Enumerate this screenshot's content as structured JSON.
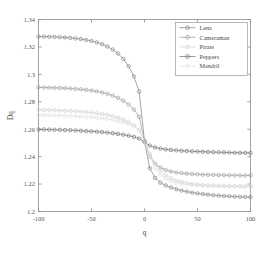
{
  "chart_data": {
    "type": "line",
    "title": "",
    "xlabel": "q",
    "ylabel": "Dq",
    "xlim": [
      -100,
      100
    ],
    "ylim": [
      1.2,
      1.34
    ],
    "grid": false,
    "legend_position": "top-right",
    "xticks": [
      "-100",
      "-50",
      "0",
      "50",
      "100"
    ],
    "xtick_values": [
      -100,
      -50,
      0,
      50,
      100
    ],
    "yticks": [
      "1.2",
      "1.22",
      "1.24",
      "1.26",
      "1.28",
      "1.3",
      "1.32",
      "1.34"
    ],
    "ytick_values": [
      1.2,
      1.22,
      1.24,
      1.26,
      1.28,
      1.3,
      1.32,
      1.34
    ],
    "marker": "circle",
    "x": [
      -100,
      -95,
      -90,
      -85,
      -80,
      -75,
      -70,
      -65,
      -60,
      -55,
      -50,
      -45,
      -40,
      -35,
      -30,
      -25,
      -20,
      -15,
      -10,
      -5,
      0,
      5,
      10,
      15,
      20,
      25,
      30,
      35,
      40,
      45,
      50,
      55,
      60,
      65,
      70,
      75,
      80,
      85,
      90,
      95,
      100
    ],
    "series": [
      {
        "name": "Lena",
        "color": "#7f7f7f",
        "values": [
          1.3275,
          1.3275,
          1.3274,
          1.3273,
          1.3271,
          1.3269,
          1.3266,
          1.3262,
          1.3257,
          1.3251,
          1.3243,
          1.3233,
          1.322,
          1.3203,
          1.3181,
          1.3152,
          1.3113,
          1.306,
          1.2985,
          1.2875,
          1.251,
          1.2315,
          1.2245,
          1.221,
          1.219,
          1.2175,
          1.2163,
          1.2153,
          1.2145,
          1.2138,
          1.2132,
          1.2127,
          1.2123,
          1.2119,
          1.2116,
          1.2113,
          1.2111,
          1.2109,
          1.2107,
          1.2106,
          1.2105
        ]
      },
      {
        "name": "Cameraman",
        "color": "#9a9a9a",
        "values": [
          1.2905,
          1.2904,
          1.2903,
          1.2902,
          1.2901,
          1.2899,
          1.2897,
          1.2894,
          1.2891,
          1.2887,
          1.2882,
          1.2876,
          1.2868,
          1.2858,
          1.2845,
          1.2829,
          1.2808,
          1.2781,
          1.2744,
          1.269,
          1.2515,
          1.24,
          1.2348,
          1.232,
          1.2303,
          1.2292,
          1.2285,
          1.228,
          1.2276,
          1.2273,
          1.2271,
          1.2269,
          1.2268,
          1.2267,
          1.2266,
          1.2265,
          1.2264,
          1.2264,
          1.2263,
          1.2263,
          1.2263
        ]
      },
      {
        "name": "Pirate",
        "color": "#d0d0d0",
        "values": [
          1.2742,
          1.2741,
          1.274,
          1.2738,
          1.2737,
          1.2735,
          1.2733,
          1.2731,
          1.2728,
          1.2725,
          1.2721,
          1.2716,
          1.2711,
          1.2704,
          1.2695,
          1.2684,
          1.267,
          1.2652,
          1.2628,
          1.2594,
          1.2508,
          1.242,
          1.235,
          1.23,
          1.2265,
          1.2242,
          1.2226,
          1.2215,
          1.2207,
          1.2201,
          1.2197,
          1.2194,
          1.2191,
          1.2189,
          1.2188,
          1.2187,
          1.2186,
          1.2185,
          1.2185,
          1.2184,
          1.2184
        ]
      },
      {
        "name": "Peppers",
        "color": "#6e6e6e",
        "values": [
          1.2598,
          1.2598,
          1.2597,
          1.2596,
          1.2595,
          1.2594,
          1.2593,
          1.2591,
          1.2589,
          1.2587,
          1.2585,
          1.2582,
          1.2579,
          1.2575,
          1.2571,
          1.2566,
          1.256,
          1.2553,
          1.2544,
          1.2532,
          1.2505,
          1.248,
          1.2467,
          1.2459,
          1.2453,
          1.2449,
          1.2446,
          1.2443,
          1.2441,
          1.2439,
          1.2437,
          1.2436,
          1.2434,
          1.2433,
          1.2432,
          1.2431,
          1.243,
          1.2429,
          1.2428,
          1.2428,
          1.2427
        ]
      },
      {
        "name": "Mandril",
        "color": "#e0e0e0",
        "values": [
          1.2703,
          1.2702,
          1.2701,
          1.27,
          1.2699,
          1.2698,
          1.2696,
          1.2694,
          1.2692,
          1.269,
          1.2687,
          1.2683,
          1.2679,
          1.2674,
          1.2668,
          1.266,
          1.265,
          1.2637,
          1.262,
          1.2595,
          1.2505,
          1.24,
          1.232,
          1.227,
          1.224,
          1.2222,
          1.221,
          1.2202,
          1.2197,
          1.2193,
          1.219,
          1.2188,
          1.2186,
          1.2185,
          1.2184,
          1.2183,
          1.2183,
          1.2182,
          1.2182,
          1.2182,
          1.2181
        ]
      }
    ]
  }
}
